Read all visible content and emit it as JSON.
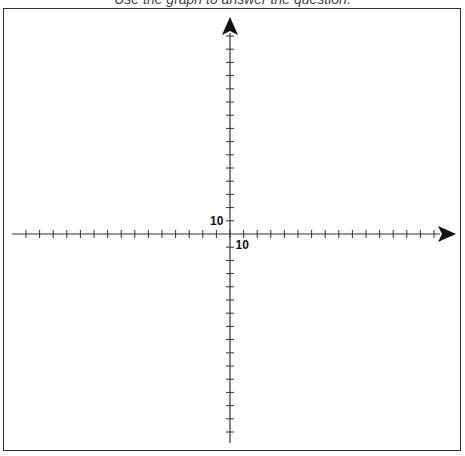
{
  "caption": "Use the graph to answer the question.",
  "chart_data": {
    "type": "coordinate-plane",
    "title": "",
    "xlabel": "",
    "ylabel": "",
    "x_tick_step": 1,
    "y_tick_step": 1,
    "x_range": [
      -15,
      15
    ],
    "y_range": [
      -15,
      15
    ],
    "labels": [
      {
        "axis": "x",
        "value": 1,
        "text": "10"
      },
      {
        "axis": "y",
        "value": 1,
        "text": "10"
      }
    ],
    "arrows": [
      "x-positive",
      "y-positive"
    ],
    "grid": false
  },
  "geometry": {
    "origin_x": 230,
    "origin_y": 234,
    "tick_px_x": 13.6,
    "tick_px_y": 13.2,
    "x_left_end": 12,
    "x_right_end": 440,
    "y_top_end": 33,
    "y_bottom_end": 443,
    "ticks_left": 15,
    "ticks_right": 15,
    "ticks_up": 15,
    "ticks_down": 15
  },
  "colors": {
    "axis": "#333333",
    "arrow": "#111111",
    "frame": "#333333"
  }
}
